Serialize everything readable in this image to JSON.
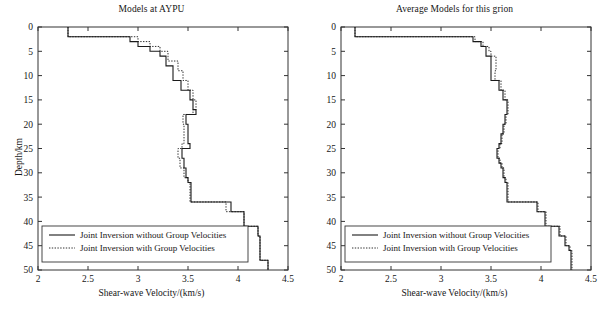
{
  "figure": {
    "width": 607,
    "height": 312,
    "background": "#ffffff",
    "line_color": "#1a1a1a",
    "axis_color": "#333333"
  },
  "panels": [
    {
      "id": "left",
      "title": "Models at AYPU",
      "xlabel": "Shear-wave Velocity/(km/s)",
      "ylabel": "Depth/km"
    },
    {
      "id": "right",
      "title": "Average Models for this grion",
      "xlabel": "Shear-wave Velocity/(km/s)",
      "ylabel": "Depth/km"
    }
  ],
  "legend": {
    "solid_label": "Joint Inversion without Group Velocities",
    "dotted_label": "Joint Inversion with Group Velocities"
  },
  "axes": {
    "x_ticks": [
      "2",
      "2.5",
      "3",
      "3.5",
      "4",
      "4.5"
    ],
    "y_ticks": [
      "0",
      "5",
      "10",
      "15",
      "20",
      "25",
      "30",
      "35",
      "40",
      "45",
      "50"
    ],
    "xlim": [
      2,
      4.5
    ],
    "ylim": [
      0,
      50
    ],
    "y_inverted": true
  },
  "chart_data": [
    {
      "type": "line",
      "title": "Models at AYPU",
      "xlabel": "Shear-wave Velocity/(km/s)",
      "ylabel": "Depth/km",
      "xlim": [
        2,
        4.5
      ],
      "ylim": [
        0,
        50
      ],
      "y_inverted": true,
      "grid": false,
      "legend_position": "bottom-left",
      "step_style": "hv",
      "series": [
        {
          "name": "Joint Inversion without Group Velocities",
          "style": "solid",
          "depth": [
            0,
            1,
            2,
            3,
            4,
            5,
            6,
            7,
            8,
            9,
            10,
            11,
            12,
            13,
            14,
            15,
            16,
            17,
            18,
            19,
            20,
            21,
            22,
            23,
            24,
            25,
            26,
            27,
            28,
            29,
            30,
            31,
            32,
            33,
            34,
            35,
            36,
            37,
            38,
            39,
            40,
            41,
            42,
            43,
            44,
            45,
            46,
            47,
            48,
            49,
            50
          ],
          "velocity": [
            2.3,
            2.3,
            2.92,
            3.0,
            3.12,
            3.22,
            3.28,
            3.28,
            3.35,
            3.35,
            3.35,
            3.43,
            3.43,
            3.52,
            3.52,
            3.55,
            3.55,
            3.58,
            3.48,
            3.48,
            3.5,
            3.5,
            3.5,
            3.5,
            3.52,
            3.44,
            3.44,
            3.46,
            3.46,
            3.48,
            3.48,
            3.5,
            3.53,
            3.53,
            3.53,
            3.53,
            3.93,
            3.93,
            4.06,
            4.06,
            4.06,
            4.2,
            4.2,
            4.22,
            4.22,
            4.22,
            4.22,
            4.22,
            4.3,
            4.3,
            4.3
          ]
        },
        {
          "name": "Joint Inversion with Group Velocities",
          "style": "dotted",
          "depth": [
            0,
            1,
            2,
            3,
            4,
            5,
            6,
            7,
            8,
            9,
            10,
            11,
            12,
            13,
            14,
            15,
            16,
            17,
            18,
            19,
            20,
            21,
            22,
            23,
            24,
            25,
            26,
            27,
            28,
            29,
            30,
            31,
            32,
            33,
            34,
            35,
            36,
            37,
            38,
            39,
            40,
            41,
            42,
            43,
            44,
            45,
            46,
            47,
            48,
            49,
            50
          ],
          "velocity": [
            2.3,
            2.3,
            3.0,
            3.12,
            3.22,
            3.3,
            3.3,
            3.4,
            3.4,
            3.45,
            3.45,
            3.5,
            3.5,
            3.55,
            3.55,
            3.58,
            3.58,
            3.55,
            3.45,
            3.45,
            3.46,
            3.46,
            3.46,
            3.46,
            3.44,
            3.4,
            3.4,
            3.42,
            3.42,
            3.46,
            3.46,
            3.5,
            3.52,
            3.52,
            3.52,
            3.52,
            3.88,
            3.88,
            4.06,
            4.06,
            4.06,
            4.2,
            4.2,
            4.22,
            4.22,
            4.22,
            4.22,
            4.22,
            4.3,
            4.3,
            4.3
          ]
        }
      ]
    },
    {
      "type": "line",
      "title": "Average Models for this grion",
      "xlabel": "Shear-wave Velocity/(km/s)",
      "ylabel": "Depth/km",
      "xlim": [
        2,
        4.5
      ],
      "ylim": [
        0,
        50
      ],
      "y_inverted": true,
      "grid": false,
      "legend_position": "bottom-left",
      "step_style": "hv",
      "series": [
        {
          "name": "Joint Inversion without Group Velocities",
          "style": "solid",
          "depth": [
            0,
            1,
            2,
            3,
            4,
            5,
            6,
            7,
            8,
            9,
            10,
            11,
            12,
            13,
            14,
            15,
            16,
            17,
            18,
            19,
            20,
            21,
            22,
            23,
            24,
            25,
            26,
            27,
            28,
            29,
            30,
            31,
            32,
            33,
            34,
            35,
            36,
            37,
            38,
            39,
            40,
            41,
            42,
            43,
            44,
            45,
            46,
            47,
            48,
            49,
            50
          ],
          "velocity": [
            2.14,
            2.14,
            3.32,
            3.4,
            3.45,
            3.45,
            3.5,
            3.5,
            3.5,
            3.5,
            3.5,
            3.58,
            3.58,
            3.62,
            3.62,
            3.66,
            3.66,
            3.66,
            3.64,
            3.64,
            3.62,
            3.62,
            3.6,
            3.6,
            3.58,
            3.56,
            3.56,
            3.58,
            3.6,
            3.62,
            3.62,
            3.64,
            3.66,
            3.66,
            3.66,
            3.66,
            3.96,
            3.96,
            4.04,
            4.04,
            4.04,
            4.18,
            4.18,
            4.24,
            4.24,
            4.28,
            4.3,
            4.3,
            4.3,
            4.3,
            4.3
          ]
        },
        {
          "name": "Joint Inversion with Group Velocities",
          "style": "dotted",
          "depth": [
            0,
            1,
            2,
            3,
            4,
            5,
            6,
            7,
            8,
            9,
            10,
            11,
            12,
            13,
            14,
            15,
            16,
            17,
            18,
            19,
            20,
            21,
            22,
            23,
            24,
            25,
            26,
            27,
            28,
            29,
            30,
            31,
            32,
            33,
            34,
            35,
            36,
            37,
            38,
            39,
            40,
            41,
            42,
            43,
            44,
            45,
            46,
            47,
            48,
            49,
            50
          ],
          "velocity": [
            2.14,
            2.14,
            3.34,
            3.42,
            3.48,
            3.5,
            3.55,
            3.55,
            3.55,
            3.54,
            3.54,
            3.6,
            3.6,
            3.64,
            3.64,
            3.67,
            3.67,
            3.67,
            3.65,
            3.65,
            3.63,
            3.63,
            3.61,
            3.61,
            3.59,
            3.57,
            3.57,
            3.59,
            3.61,
            3.63,
            3.63,
            3.65,
            3.67,
            3.67,
            3.67,
            3.67,
            3.97,
            3.97,
            4.05,
            4.05,
            4.05,
            4.19,
            4.19,
            4.25,
            4.25,
            4.29,
            4.31,
            4.31,
            4.31,
            4.31,
            4.31
          ]
        }
      ]
    }
  ]
}
